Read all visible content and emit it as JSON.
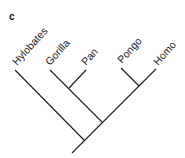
{
  "figure": {
    "panel_label": "c",
    "type": "phylogenetic-tree",
    "taxa": [
      "Hylobates",
      "Gorilla",
      "Pan",
      "Pongo",
      "Homo"
    ],
    "topology": "(Hylobates,((Gorilla,Pan),(Pongo,Homo)))",
    "colors": {
      "line": "#1a1a1a",
      "text": "#222222",
      "background": "#ffffff"
    }
  }
}
